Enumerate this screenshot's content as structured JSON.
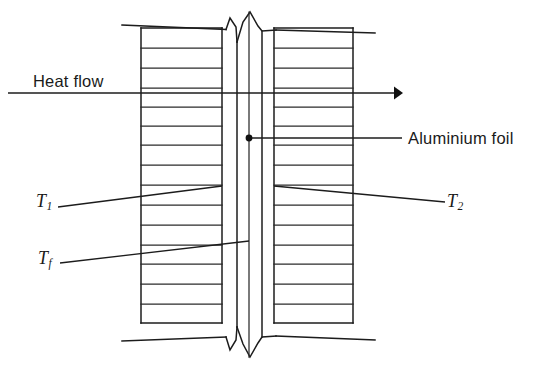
{
  "figure": {
    "background_color": "#ffffff",
    "line_color": "#1c1c1c",
    "width": 549,
    "height": 371
  },
  "labels": {
    "heat_flow": "Heat flow",
    "aluminium_foil": "Aluminium foil",
    "t1_symbol": "T",
    "t1_subscript": "1",
    "t2_symbol": "T",
    "t2_subscript": "2",
    "tf_symbol": "T",
    "tf_subscript": "f"
  },
  "icons": {
    "heat_flow_arrow": "arrow-right-icon",
    "foil_marker": "dot-marker-icon"
  },
  "geometry": {
    "left_block": {
      "x1": 141,
      "x2": 222,
      "y1": 28,
      "y2": 323
    },
    "right_block": {
      "x1": 274,
      "x2": 353,
      "y1": 28,
      "y2": 323
    },
    "foil_line_x": 249,
    "foil_marker": {
      "x": 249,
      "y": 138
    },
    "heat_flow_arrow": {
      "y": 93,
      "x_start": 8,
      "x_end": 402
    },
    "top_outer_line": {
      "x_start": 122,
      "y_start": 25,
      "x_end": 375,
      "y_end": 33
    },
    "bottom_outer_line": {
      "x_start": 122,
      "y_start": 333,
      "x_end": 375,
      "y_end": 341
    },
    "left_layer_line_y": [
      28,
      48,
      68,
      88,
      107,
      126,
      145,
      165,
      185,
      205,
      225,
      245,
      264,
      284,
      304,
      323
    ],
    "right_layer_line_y": [
      28,
      48,
      68,
      88,
      107,
      126,
      145,
      165,
      185,
      205,
      225,
      245,
      264,
      284,
      304,
      323
    ],
    "t1_leader": {
      "x1": 58,
      "y1": 207,
      "x2": 222,
      "y2": 186
    },
    "tf_leader": {
      "x1": 60,
      "y1": 263,
      "x2": 249,
      "y2": 241
    },
    "t2_leader": {
      "x1": 274,
      "y1": 186,
      "x2": 445,
      "y2": 202
    },
    "foil_leader": {
      "x1": 249,
      "y1": 138,
      "x2": 402,
      "y2": 138
    }
  }
}
